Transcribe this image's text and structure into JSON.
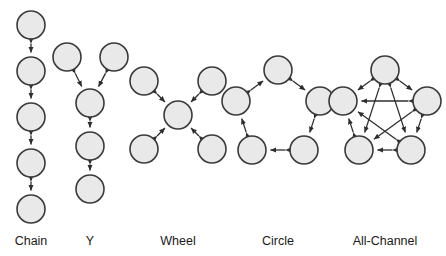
{
  "figure": {
    "background_color": "#ffffff",
    "node_fill_color": "#e9e9e9",
    "node_stroke_color": "#3a3a3a",
    "edge_color": "#2e2e2e",
    "label_color": "#1a1a1a",
    "node_radius": 14
  },
  "patterns": [
    {
      "id": "chain",
      "label": "Chain",
      "label_x": 31,
      "label_y": 245,
      "node_count": 5,
      "edge_count": 4,
      "arrow_style": "double-headed",
      "nodes": [
        {
          "id": "c1",
          "cx": 31,
          "cy": 25
        },
        {
          "id": "c2",
          "cx": 31,
          "cy": 71
        },
        {
          "id": "c3",
          "cx": 31,
          "cy": 117
        },
        {
          "id": "c4",
          "cx": 31,
          "cy": 163
        },
        {
          "id": "c5",
          "cx": 31,
          "cy": 209
        }
      ],
      "edges": [
        {
          "from": "c1",
          "to": "c2"
        },
        {
          "from": "c2",
          "to": "c3"
        },
        {
          "from": "c3",
          "to": "c4"
        },
        {
          "from": "c4",
          "to": "c5"
        }
      ]
    },
    {
      "id": "y",
      "label": "Y",
      "label_x": 90,
      "label_y": 245,
      "node_count": 5,
      "edge_count": 4,
      "arrow_style": "double-headed",
      "nodes": [
        {
          "id": "y1",
          "cx": 67,
          "cy": 57
        },
        {
          "id": "y2",
          "cx": 114,
          "cy": 57
        },
        {
          "id": "y3",
          "cx": 90,
          "cy": 103
        },
        {
          "id": "y4",
          "cx": 90,
          "cy": 146
        },
        {
          "id": "y5",
          "cx": 90,
          "cy": 189
        }
      ],
      "edges": [
        {
          "from": "y1",
          "to": "y3"
        },
        {
          "from": "y2",
          "to": "y3"
        },
        {
          "from": "y3",
          "to": "y4"
        },
        {
          "from": "y4",
          "to": "y5"
        }
      ]
    },
    {
      "id": "wheel",
      "label": "Wheel",
      "label_x": 178,
      "label_y": 245,
      "node_count": 5,
      "edge_count": 4,
      "arrow_style": "double-headed",
      "nodes": [
        {
          "id": "w_center",
          "cx": 178,
          "cy": 115
        },
        {
          "id": "w_tl",
          "cx": 144,
          "cy": 81
        },
        {
          "id": "w_tr",
          "cx": 212,
          "cy": 81
        },
        {
          "id": "w_bl",
          "cx": 144,
          "cy": 149
        },
        {
          "id": "w_br",
          "cx": 212,
          "cy": 149
        }
      ],
      "edges": [
        {
          "from": "w_tl",
          "to": "w_center"
        },
        {
          "from": "w_tr",
          "to": "w_center"
        },
        {
          "from": "w_bl",
          "to": "w_center"
        },
        {
          "from": "w_br",
          "to": "w_center"
        }
      ]
    },
    {
      "id": "circle",
      "label": "Circle",
      "label_x": 278,
      "label_y": 245,
      "node_count": 5,
      "edge_count": 5,
      "arrow_style": "double-headed",
      "nodes": [
        {
          "id": "r_top",
          "cx": 278,
          "cy": 70
        },
        {
          "id": "r_right",
          "cx": 320,
          "cy": 101
        },
        {
          "id": "r_br",
          "cx": 304,
          "cy": 150
        },
        {
          "id": "r_bl",
          "cx": 252,
          "cy": 150
        },
        {
          "id": "r_left",
          "cx": 236,
          "cy": 101
        }
      ],
      "edges": [
        {
          "from": "r_top",
          "to": "r_right"
        },
        {
          "from": "r_right",
          "to": "r_br"
        },
        {
          "from": "r_br",
          "to": "r_bl"
        },
        {
          "from": "r_bl",
          "to": "r_left"
        },
        {
          "from": "r_left",
          "to": "r_top"
        }
      ]
    },
    {
      "id": "all-channel",
      "label": "All-Channel",
      "label_x": 385,
      "label_y": 245,
      "node_count": 5,
      "edge_count": 10,
      "arrow_style": "double-headed",
      "nodes": [
        {
          "id": "a_top",
          "cx": 385,
          "cy": 70
        },
        {
          "id": "a_right",
          "cx": 427,
          "cy": 101
        },
        {
          "id": "a_br",
          "cx": 411,
          "cy": 150
        },
        {
          "id": "a_bl",
          "cx": 359,
          "cy": 150
        },
        {
          "id": "a_left",
          "cx": 343,
          "cy": 101
        }
      ],
      "edges": [
        {
          "from": "a_top",
          "to": "a_right"
        },
        {
          "from": "a_top",
          "to": "a_br"
        },
        {
          "from": "a_top",
          "to": "a_bl"
        },
        {
          "from": "a_top",
          "to": "a_left"
        },
        {
          "from": "a_right",
          "to": "a_br"
        },
        {
          "from": "a_right",
          "to": "a_bl"
        },
        {
          "from": "a_right",
          "to": "a_left"
        },
        {
          "from": "a_br",
          "to": "a_bl"
        },
        {
          "from": "a_br",
          "to": "a_left"
        },
        {
          "from": "a_bl",
          "to": "a_left"
        }
      ]
    }
  ]
}
